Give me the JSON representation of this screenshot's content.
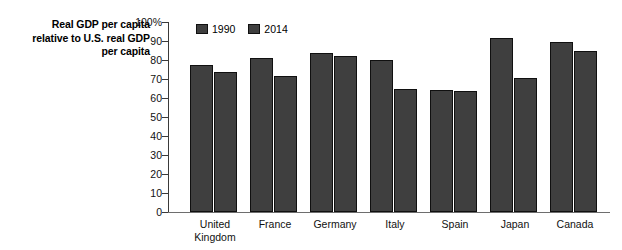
{
  "chart_data": {
    "type": "bar",
    "title": "",
    "ylabel": "Real GDP per capita relative to U.S. real GDP per capita",
    "ylabel_lines": [
      "Real GDP per capita",
      "relative to U.S. real GDP",
      "per capita"
    ],
    "xlabel": "",
    "ylim": [
      0,
      100
    ],
    "y_ticks": [
      0,
      10,
      20,
      30,
      40,
      50,
      60,
      70,
      80,
      90,
      100
    ],
    "y_tick_labels": [
      "0",
      "10",
      "20",
      "30",
      "40",
      "50",
      "60",
      "70",
      "80",
      "90",
      "100%"
    ],
    "grid": false,
    "legend_position": "top-left-inside",
    "categories": [
      "United Kingdom",
      "France",
      "Germany",
      "Italy",
      "Spain",
      "Japan",
      "Canada"
    ],
    "category_lines": [
      [
        "United",
        "Kingdom"
      ],
      [
        "France"
      ],
      [
        "Germany"
      ],
      [
        "Italy"
      ],
      [
        "Spain"
      ],
      [
        "Japan"
      ],
      [
        "Canada"
      ]
    ],
    "series": [
      {
        "name": "1990",
        "color": "#3f3f3f",
        "values": [
          77.5,
          81,
          83.5,
          80,
          64,
          91.5,
          89.5
        ]
      },
      {
        "name": "2014",
        "color": "#3f3f3f",
        "values": [
          73.5,
          71.5,
          82,
          64.5,
          63.5,
          70.5,
          85
        ]
      }
    ]
  },
  "colors": {
    "bar_fill": "#3f3f3f",
    "bar_stroke": "#101010",
    "axis": "#3a3a3a",
    "background": "#ffffff"
  }
}
